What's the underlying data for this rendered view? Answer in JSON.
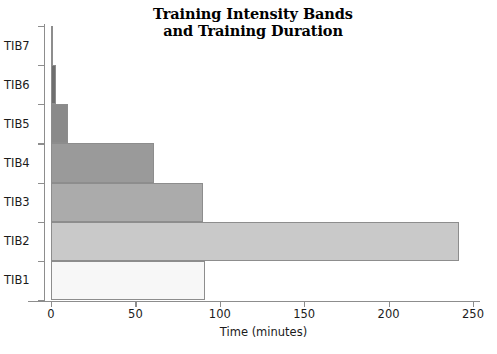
{
  "chart_data": {
    "type": "bar",
    "orientation": "horizontal",
    "title": "Training Intensity Bands and Training Duration",
    "title_lines": [
      "Training Intensity Bands",
      "and Training Duration"
    ],
    "xlabel": "Time (minutes)",
    "ylabel": "",
    "categories": [
      "TIB1",
      "TIB2",
      "TIB3",
      "TIB4",
      "TIB5",
      "TIB6",
      "TIB7"
    ],
    "values": [
      91,
      242,
      90,
      61,
      10,
      3,
      1
    ],
    "bar_colors": [
      "#f7f7f7",
      "#c9c9c9",
      "#ababab",
      "#9a9a9a",
      "#8a8a8a",
      "#6e6e6e",
      "#5a5a5a"
    ],
    "bar_edge_color": "#8d8d8d",
    "xlim": [
      0,
      250
    ],
    "xticks": [
      0,
      50,
      100,
      150,
      200,
      250
    ],
    "xtick_labels": [
      "0",
      "50",
      "100",
      "150",
      "200",
      "250"
    ],
    "grid": false,
    "legend": null,
    "axis_color": "#8d8d8d",
    "background": "#ffffff",
    "category_order_top_to_bottom": [
      "TIB7",
      "TIB6",
      "TIB5",
      "TIB4",
      "TIB3",
      "TIB2",
      "TIB1"
    ],
    "bars": [
      {
        "label": "TIB7",
        "value": 1,
        "color": "#5a5a5a"
      },
      {
        "label": "TIB6",
        "value": 3,
        "color": "#6e6e6e"
      },
      {
        "label": "TIB5",
        "value": 10,
        "color": "#8a8a8a"
      },
      {
        "label": "TIB4",
        "value": 61,
        "color": "#9a9a9a"
      },
      {
        "label": "TIB3",
        "value": 90,
        "color": "#ababab"
      },
      {
        "label": "TIB2",
        "value": 242,
        "color": "#c9c9c9"
      },
      {
        "label": "TIB1",
        "value": 91,
        "color": "#f7f7f7"
      }
    ]
  }
}
